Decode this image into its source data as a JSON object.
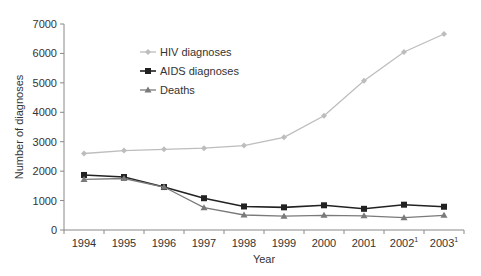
{
  "chart_data": {
    "type": "line",
    "title": "",
    "xlabel": "Year",
    "ylabel": "Number of diagnoses",
    "categories": [
      "1994",
      "1995",
      "1996",
      "1997",
      "1998",
      "1999",
      "2000",
      "2001",
      "2002",
      "2003"
    ],
    "category_superscripts": [
      "",
      "",
      "",
      "",
      "",
      "",
      "",
      "",
      "1",
      "1"
    ],
    "ylim": [
      0,
      7000
    ],
    "yticks": [
      0,
      1000,
      2000,
      3000,
      4000,
      5000,
      6000,
      7000
    ],
    "grid": false,
    "legend_position": "upper-left-inside",
    "series": [
      {
        "name": "HIV diagnoses",
        "color": "#bdbdbd",
        "marker": "diamond",
        "values": [
          2600,
          2700,
          2740,
          2780,
          2870,
          3150,
          3880,
          5070,
          6050,
          6660
        ]
      },
      {
        "name": "AIDS diagnoses",
        "color": "#222222",
        "marker": "square",
        "values": [
          1870,
          1800,
          1460,
          1080,
          800,
          770,
          840,
          720,
          860,
          790
        ]
      },
      {
        "name": "Deaths",
        "color": "#7a7a7a",
        "marker": "triangle",
        "values": [
          1720,
          1750,
          1460,
          760,
          510,
          470,
          500,
          480,
          420,
          500
        ]
      }
    ]
  },
  "colors": {
    "axis": "#888888",
    "text": "#333333",
    "background": "#ffffff"
  }
}
